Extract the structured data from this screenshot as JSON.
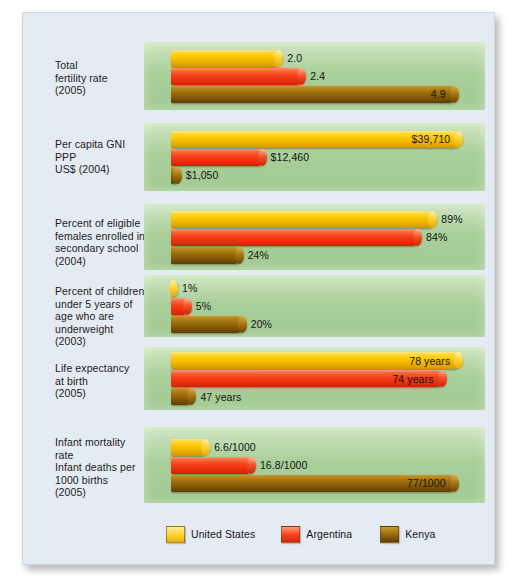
{
  "chart_data": {
    "type": "bar",
    "title": "",
    "xlabel": "",
    "ylabel": "",
    "grid": false,
    "legend_position": "bottom",
    "series": [
      {
        "name": "United States",
        "color": "#fbc600"
      },
      {
        "name": "Argentina",
        "color": "#f4421d"
      },
      {
        "name": "Kenya",
        "color": "#9a6c0e"
      }
    ],
    "categories": [
      "Total fertility rate (2005)",
      "Per capita GNI PPP US$ (2004)",
      "Percent of eligible females enrolled in secondary school (2004)",
      "Percent of children under 5 years of age who are underweight (2003)",
      "Life expectancy at birth (2005)",
      "Infant mortality rate Infant deaths per 1000 births (2005)"
    ],
    "groups": [
      {
        "label_lines": [
          "Total",
          "fertility rate",
          "(2005)"
        ],
        "bars": [
          {
            "series": "United States",
            "value": 2.0,
            "display": "2.0",
            "width_pct": 36.5,
            "label_position": "outside"
          },
          {
            "series": "Argentina",
            "value": 2.4,
            "display": "2.4",
            "width_pct": 44.0,
            "label_position": "outside"
          },
          {
            "series": "Kenya",
            "value": 4.9,
            "display": "4.9",
            "width_pct": 94.0,
            "label_position": "inside"
          }
        ]
      },
      {
        "label_lines": [
          "Per capita GNI",
          "PPP",
          "US$ (2004)"
        ],
        "bars": [
          {
            "series": "United States",
            "value": 39710,
            "display": "$39,710",
            "width_pct": 95.5,
            "label_position": "inside"
          },
          {
            "series": "Argentina",
            "value": 12460,
            "display": "$12,460",
            "width_pct": 31.0,
            "label_position": "outside"
          },
          {
            "series": "Kenya",
            "value": 1050,
            "display": "$1,050",
            "width_pct": 3.2,
            "label_position": "outside"
          }
        ]
      },
      {
        "label_lines": [
          "Percent of eligible",
          "females enrolled in",
          "secondary school",
          "(2004)"
        ],
        "bars": [
          {
            "series": "United States",
            "value": 89,
            "display": "89%",
            "width_pct": 87.0,
            "label_position": "outside"
          },
          {
            "series": "Argentina",
            "value": 84,
            "display": "84%",
            "width_pct": 82.0,
            "label_position": "outside"
          },
          {
            "series": "Kenya",
            "value": 24,
            "display": "24%",
            "width_pct": 23.5,
            "label_position": "outside"
          }
        ]
      },
      {
        "label_lines": [
          "Percent of children",
          "under 5 years of",
          "age who are",
          "underweight",
          "(2003)"
        ],
        "bars": [
          {
            "series": "United States",
            "value": 1,
            "display": "1%",
            "width_pct": 1.5,
            "label_position": "outside"
          },
          {
            "series": "Argentina",
            "value": 5,
            "display": "5%",
            "width_pct": 6.5,
            "label_position": "outside"
          },
          {
            "series": "Kenya",
            "value": 20,
            "display": "20%",
            "width_pct": 24.5,
            "label_position": "outside"
          }
        ]
      },
      {
        "label_lines": [
          "Life expectancy",
          "at birth",
          "(2005)"
        ],
        "bars": [
          {
            "series": "United States",
            "value": 78,
            "display": "78 years",
            "width_pct": 95.5,
            "label_position": "inside"
          },
          {
            "series": "Argentina",
            "value": 74,
            "display": "74 years",
            "width_pct": 90.0,
            "label_position": "inside"
          },
          {
            "series": "Kenya",
            "value": 47,
            "display": "47 years",
            "width_pct": 8.0,
            "label_position": "outside"
          }
        ]
      },
      {
        "label_lines": [
          "Infant mortality",
          "rate",
          "Infant deaths per",
          "1000 births",
          "(2005)"
        ],
        "bars": [
          {
            "series": "United States",
            "value": 6.6,
            "display": "6.6/1000",
            "width_pct": 12.5,
            "label_position": "outside"
          },
          {
            "series": "Argentina",
            "value": 16.8,
            "display": "16.8/1000",
            "width_pct": 27.5,
            "label_position": "outside"
          },
          {
            "series": "Kenya",
            "value": 77,
            "display": "77/1000",
            "width_pct": 94.0,
            "label_position": "inside"
          }
        ]
      }
    ]
  },
  "legend": {
    "items": [
      {
        "label": "United States",
        "key": "us"
      },
      {
        "label": "Argentina",
        "key": "ar"
      },
      {
        "label": "Kenya",
        "key": "ke"
      }
    ]
  }
}
